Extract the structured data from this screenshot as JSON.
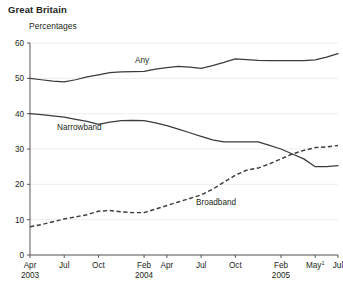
{
  "header": {
    "title": "Great Britain",
    "subtitle": "Percentages"
  },
  "chart_data": {
    "type": "line",
    "title": "Great Britain",
    "subtitle": "Percentages",
    "xlabel": "",
    "ylabel": "Percentages",
    "ylim": [
      0,
      60
    ],
    "yticks": [
      0,
      10,
      20,
      30,
      40,
      50,
      60
    ],
    "grid": true,
    "legend_position": "inline-labels",
    "x_tick_labels": [
      {
        "label": "Apr",
        "year": "2003",
        "index": 0
      },
      {
        "label": "Jul",
        "year": "",
        "index": 3
      },
      {
        "label": "Oct",
        "year": "",
        "index": 6
      },
      {
        "label": "Feb",
        "year": "2004",
        "index": 10
      },
      {
        "label": "Apr",
        "year": "",
        "index": 12
      },
      {
        "label": "Jul",
        "year": "",
        "index": 15
      },
      {
        "label": "Oct",
        "year": "",
        "index": 18
      },
      {
        "label": "Feb",
        "year": "2005",
        "index": 22
      },
      {
        "label": "May",
        "year": "",
        "index": 25,
        "footnote": "1"
      },
      {
        "label": "Jul",
        "year": "",
        "index": 27
      }
    ],
    "x": [
      "Apr 2003",
      "May 2003",
      "Jun 2003",
      "Jul 2003",
      "Aug 2003",
      "Sep 2003",
      "Oct 2003",
      "Nov 2003",
      "Dec 2003",
      "Jan 2004",
      "Feb 2004",
      "Mar 2004",
      "Apr 2004",
      "May 2004",
      "Jun 2004",
      "Jul 2004",
      "Aug 2004",
      "Sep 2004",
      "Oct 2004",
      "Nov 2004",
      "Dec 2004",
      "Jan 2005",
      "Feb 2005",
      "Mar 2005",
      "Apr 2005",
      "May 2005",
      "Jun 2005",
      "Jul 2005"
    ],
    "series": [
      {
        "name": "Any",
        "style": "solid",
        "label_text": "Any",
        "values": [
          50,
          49.6,
          49.2,
          49,
          49.6,
          50.4,
          51,
          51.6,
          51.8,
          51.9,
          52,
          52.6,
          53,
          53.4,
          53.2,
          52.8,
          53.6,
          54.5,
          55.5,
          55.3,
          55.1,
          55,
          55,
          55,
          55,
          55.2,
          56,
          57
        ]
      },
      {
        "name": "Narrowband",
        "style": "solid",
        "label_text": "Narrowband",
        "values": [
          40,
          39.7,
          39.4,
          39,
          38.4,
          37.8,
          37,
          37.6,
          38,
          38.1,
          38,
          37.4,
          36.6,
          35.6,
          34.6,
          33.6,
          32.6,
          32,
          32,
          32,
          32,
          31,
          30,
          28.6,
          27.2,
          25,
          25,
          25.3
        ]
      },
      {
        "name": "Broadband",
        "style": "dashed",
        "label_text": "Broadband",
        "values": [
          8,
          8.6,
          9.4,
          10.2,
          10.8,
          11.4,
          12.4,
          12.6,
          12.2,
          12,
          12,
          13,
          14,
          15,
          16,
          17,
          18.6,
          20.6,
          22.6,
          24,
          24.6,
          25.8,
          27.2,
          28.6,
          29.6,
          30.4,
          30.6,
          31
        ]
      }
    ]
  },
  "colors": {
    "line": "#3b3b3d",
    "axis": "#58595b",
    "grid": "#e9e9ea",
    "text": "#231f20",
    "background": "#ffffff"
  }
}
